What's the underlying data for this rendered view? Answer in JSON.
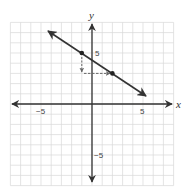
{
  "chart_data": {
    "type": "line",
    "title": "",
    "xlabel": "x",
    "ylabel": "y",
    "xlim": [
      -8,
      8
    ],
    "ylim": [
      -8,
      8
    ],
    "grid": true,
    "x_tick_labels": [
      {
        "value": -5,
        "label": "−5"
      },
      {
        "value": 5,
        "label": "5"
      }
    ],
    "y_tick_labels": [
      {
        "value": 5,
        "label": "5"
      },
      {
        "value": -5,
        "label": "−5"
      }
    ],
    "series": [
      {
        "name": "line",
        "equation": "y = -2/3 x + 13/3",
        "slope": -0.6667,
        "points": [
          {
            "x": -1,
            "y": 5
          },
          {
            "x": 2,
            "y": 3
          }
        ],
        "extent": {
          "x_start": -4.3,
          "x_end": 5.3
        }
      }
    ],
    "annotations": [
      {
        "type": "dashed-arrow",
        "direction": "down",
        "from": {
          "x": -1,
          "y": 5
        },
        "to": {
          "x": -1,
          "y": 3
        },
        "meaning": "rise -2"
      },
      {
        "type": "dashed-arrow",
        "direction": "right",
        "from": {
          "x": -1,
          "y": 3
        },
        "to": {
          "x": 2,
          "y": 3
        },
        "meaning": "run 3"
      }
    ]
  },
  "labels": {
    "x_axis": "x",
    "y_axis": "y",
    "x_neg5": "−5",
    "x_pos5": "5",
    "y_pos5": "5",
    "y_neg5": "−5"
  },
  "colors": {
    "grid": "#d8d8d8",
    "axis": "#333333",
    "line": "#333333",
    "annotation": "#666666"
  }
}
